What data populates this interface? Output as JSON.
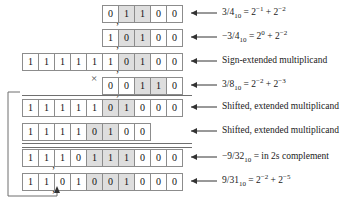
{
  "figure": {
    "cell_shade_color": "#dedede",
    "cell_border_color": "#8c8c8c",
    "times_symbol": "×"
  },
  "rows": [
    {
      "id": "multiplicand",
      "bits": [
        "0",
        "1",
        "1",
        "0",
        "0"
      ],
      "shaded": [
        false,
        true,
        true,
        false,
        false
      ],
      "point_after_index": 0,
      "annotation": "3/4₁₀ = 2⁻¹ + 2⁻²",
      "has_arrow": true
    },
    {
      "id": "negative-multiplicand",
      "bits": [
        "1",
        "0",
        "1",
        "0",
        "0"
      ],
      "shaded": [
        false,
        true,
        true,
        false,
        false
      ],
      "point_after_index": 0,
      "annotation": "−3/4₁₀ = 2⁰ + 2⁻²",
      "has_arrow": true
    },
    {
      "id": "sign-extended-multiplicand",
      "bits": [
        "1",
        "1",
        "1",
        "1",
        "1",
        "1",
        "0",
        "1",
        "0",
        "0"
      ],
      "shaded": [
        false,
        false,
        false,
        false,
        false,
        false,
        true,
        true,
        false,
        false
      ],
      "point_after_index": 5,
      "annotation": "Sign-extended multiplicand",
      "has_arrow": true
    },
    {
      "id": "multiplier",
      "bits": [
        "0",
        "0",
        "1",
        "1",
        "0"
      ],
      "shaded": [
        false,
        false,
        true,
        true,
        false
      ],
      "point_after_index": 0,
      "annotation": "3/8₁₀ = 2⁻² + 2⁻³",
      "has_arrow": true
    },
    {
      "id": "shifted-extended-multiplicand-1",
      "bits": [
        "1",
        "1",
        "1",
        "1",
        "1",
        "0",
        "1",
        "0",
        "0",
        "0"
      ],
      "shaded": [
        false,
        false,
        false,
        false,
        false,
        true,
        true,
        false,
        false,
        false
      ],
      "point_after_index": -1,
      "annotation": "Shifted, extended multiplicand",
      "has_arrow": true
    },
    {
      "id": "shifted-extended-multiplicand-2",
      "bits": [
        "1",
        "1",
        "1",
        "1",
        "0",
        "1",
        "0",
        "0"
      ],
      "shaded": [
        false,
        false,
        false,
        false,
        true,
        true,
        false,
        false
      ],
      "point_after_index": -1,
      "annotation": "Shifted, extended multiplicand",
      "has_arrow": true
    },
    {
      "id": "product-2s-complement",
      "bits": [
        "1",
        "1",
        "1",
        "0",
        "1",
        "1",
        "1",
        "0",
        "0",
        "0"
      ],
      "shaded": [
        false,
        false,
        false,
        false,
        true,
        true,
        true,
        false,
        false,
        false
      ],
      "point_after_index": 1,
      "annotation": "−9/32₁₀ = in 2s complement",
      "has_arrow": true
    },
    {
      "id": "product-magnitude",
      "bits": [
        "1",
        "1",
        "0",
        "1",
        "0",
        "0",
        "1",
        "0",
        "0",
        "0"
      ],
      "shaded": [
        false,
        false,
        false,
        false,
        true,
        true,
        true,
        false,
        false,
        false
      ],
      "point_after_index": 1,
      "annotation": "9/31₁₀ = 2⁻² + 2⁻⁵",
      "has_arrow": true
    }
  ],
  "caption": {
    "text": ""
  }
}
